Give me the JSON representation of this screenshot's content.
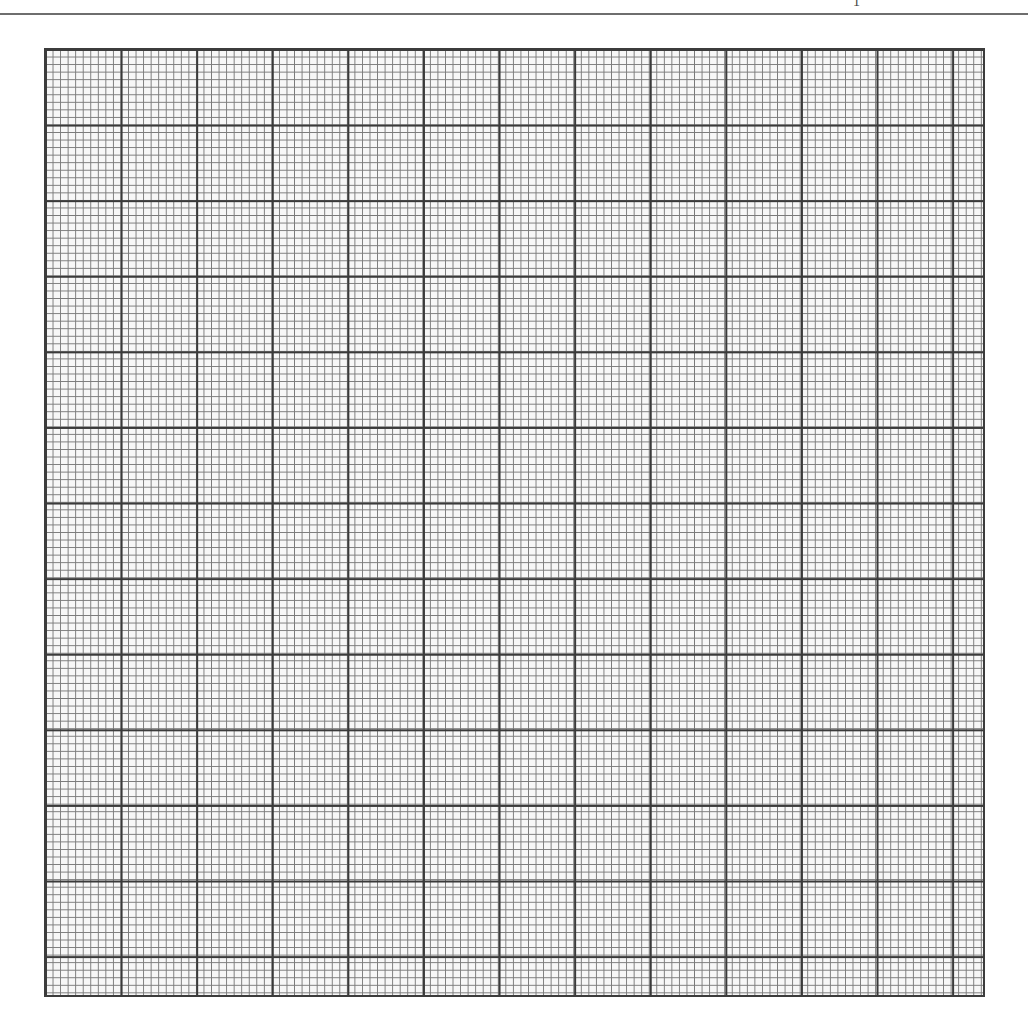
{
  "page": {
    "header_mark": "1",
    "sheet": {
      "type": "graph-paper",
      "major_divisions_x": 12.4,
      "major_divisions_y": 12.5,
      "minor_per_major": 10,
      "line_color_major": "#3a3a3a",
      "line_color_minor": "#7a7a7a",
      "background_color": "#f7f7f7"
    }
  }
}
